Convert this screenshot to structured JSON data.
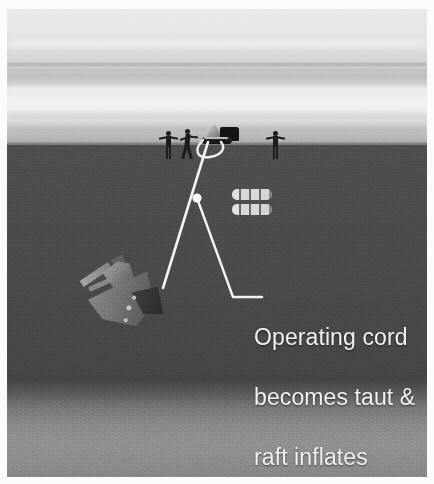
{
  "image": {
    "title": "Life raft deployment from sinking vessel",
    "scene_type": "underwater cross-section illustration",
    "background_color": "#ffffff",
    "plate_border_color": "#fbfbfb"
  },
  "sky": {
    "name": "overcast sky above sea",
    "top_color": "#eceaea",
    "horizon_glow_color": "#f4f5f5",
    "bottom_color": "#a9abab"
  },
  "sea": {
    "surface_line_label": "sea surface",
    "water_color": "#4a4a4a",
    "seabed_color": "#8f8f8f",
    "seabed_label": "sea floor"
  },
  "surface_scene": {
    "figures": [
      {
        "name": "survivor-standing-left",
        "pose": "standing arms out",
        "x": 158,
        "y": 128
      },
      {
        "name": "survivor-running",
        "pose": "running toward raft",
        "x": 178,
        "y": 127
      },
      {
        "name": "survivor-standing-right",
        "pose": "standing arms out",
        "x": 265,
        "y": 128
      }
    ],
    "raft": {
      "name": "inflated-life-raft",
      "label": "life raft with canopy",
      "x": 198,
      "y": 122
    }
  },
  "bubbles": {
    "name": "gas-cylinder-bubbles",
    "label": "rising gas / bubble trail",
    "rows": 2,
    "segments_per_row": 4,
    "x": 228,
    "y": 182
  },
  "ship": {
    "name": "sinking-vessel",
    "label": "sinking ship descending bow-down",
    "rotation_deg": -28,
    "x": 88,
    "y": 248
  },
  "cord": {
    "name": "operating-cord",
    "label": "operating cord linking raft to sinking ship",
    "color": "#f4f4f4",
    "raft_anchor": {
      "x": 208,
      "y": 142
    },
    "ship_anchor": {
      "x": 163,
      "y": 288
    },
    "painter_loop_label": "slack painter line at raft"
  },
  "callout": {
    "name": "operating-cord-callout",
    "marker_label": "cord junction marker dot",
    "marker": {
      "x": 197,
      "y": 196
    },
    "elbow": {
      "x": 233,
      "y": 295
    },
    "line_end": {
      "x": 262,
      "y": 295
    },
    "text_color": "#f2f2f2",
    "lines": [
      "Operating cord",
      "becomes taut &",
      "raft inflates"
    ]
  }
}
